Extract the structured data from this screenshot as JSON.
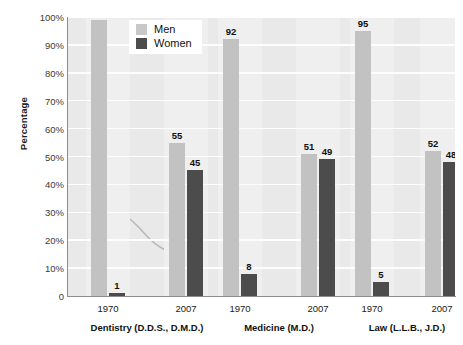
{
  "chart_data": {
    "type": "bar",
    "title": "",
    "subtitle": "",
    "xlabel": "",
    "ylabel": "Percentage",
    "ylim": [
      0,
      100
    ],
    "grid": true,
    "legend_position": "top-center-inside",
    "categories": [
      "1970",
      "2007",
      "1970",
      "2007",
      "1970",
      "2007"
    ],
    "group_labels": [
      "Dentistry (D.D.S., D.M.D.)",
      "Medicine (M.D.)",
      "Law (L.L.B., J.D.)"
    ],
    "groups": [
      {
        "label": "Dentistry (D.D.S., D.M.D.)",
        "bars": [
          {
            "year": "1970",
            "men": 99,
            "women": 1
          },
          {
            "year": "2007",
            "men": 55,
            "women": 45
          }
        ]
      },
      {
        "label": "Medicine (M.D.)",
        "bars": [
          {
            "year": "1970",
            "men": 92,
            "women": 8
          },
          {
            "year": "2007",
            "men": 51,
            "women": 49
          }
        ]
      },
      {
        "label": "Law (L.L.B., J.D.)",
        "bars": [
          {
            "year": "1970",
            "men": 95,
            "women": 5
          },
          {
            "year": "2007",
            "men": 52,
            "women": 48
          }
        ]
      }
    ],
    "series": [
      {
        "name": "Men",
        "values": [
          99,
          55,
          92,
          51,
          95,
          52
        ],
        "color": "#c2c2c2"
      },
      {
        "name": "Women",
        "values": [
          1,
          45,
          8,
          49,
          5,
          48
        ],
        "color": "#4c4c4c"
      }
    ],
    "y_ticks": [
      "0",
      "10%",
      "20%",
      "30%",
      "40%",
      "50%",
      "60%",
      "70%",
      "80%",
      "90%",
      "100%"
    ],
    "y_tick_values": [
      0,
      10,
      20,
      30,
      40,
      50,
      60,
      70,
      80,
      90,
      100
    ]
  },
  "legend": {
    "items": [
      {
        "label": "Men",
        "color": "#c8c8c8"
      },
      {
        "label": "Women",
        "color": "#4c4c4c"
      }
    ]
  },
  "axes": {
    "y_title": "Percentage"
  },
  "colors": {
    "men_bar": "#c2c2c2",
    "women_bar": "#4c4c4c",
    "plot_background": "#e9e9e9",
    "gridline": "#fdfdfd",
    "axis_line": "#8c8c8c"
  }
}
